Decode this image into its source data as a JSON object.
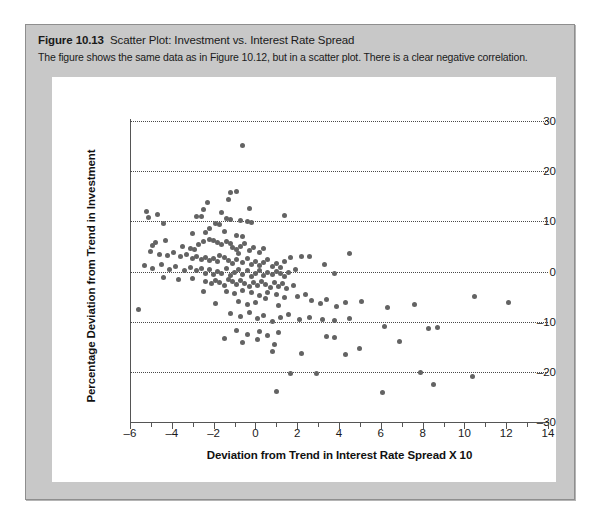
{
  "caption": {
    "figure_number": "Figure 10.13",
    "title": "Scatter Plot: Investment vs. Interest Rate Spread",
    "description": "The figure shows the same data as in Figure 10.12, but in a scatter plot. There is a clear negative correlation."
  },
  "colors": {
    "card_background": "#c8c8c8",
    "card_border": "#8e8e8e",
    "plot_background": "#ffffff",
    "dot": "#636363",
    "axis": "#555555",
    "gridline": "#4a4a4a",
    "text": "#1a1a1a"
  },
  "chart_data": {
    "type": "scatter",
    "title": "Scatter Plot: Investment vs. Interest Rate Spread",
    "xlabel": "Deviation from Trend in Interest Rate Spread X 10",
    "ylabel": "Percentage Deviation from Trend in Investment",
    "xlim": [
      -6,
      14
    ],
    "ylim": [
      -30,
      30
    ],
    "x_ticks": [
      -6,
      -4,
      -2,
      0,
      2,
      4,
      6,
      8,
      10,
      12,
      14
    ],
    "x_tick_labels": [
      "–6",
      "–4",
      "–2",
      "0",
      "2",
      "4",
      "6",
      "8",
      "10",
      "12",
      "14"
    ],
    "x_minor_ticks": [
      -5,
      -3,
      -1,
      1,
      3,
      5,
      7,
      9,
      11,
      13
    ],
    "y_ticks": [
      -30,
      -20,
      -10,
      0,
      10,
      20,
      30
    ],
    "y_tick_labels": [
      "–30",
      "–20",
      "–10",
      "0",
      "10",
      "20",
      "30"
    ],
    "grid": "horizontal-dotted",
    "legend": null,
    "annotations": [
      "There is a clear negative correlation."
    ],
    "marker": {
      "shape": "circle",
      "size_px": 5,
      "color": "#636363"
    },
    "series": [
      {
        "name": "Investment vs. Interest Rate Spread",
        "points": [
          [
            -0.6,
            25.2
          ],
          [
            -1.2,
            15.8
          ],
          [
            -0.9,
            16.0
          ],
          [
            -1.3,
            14.3
          ],
          [
            -2.3,
            13.8
          ],
          [
            -2.5,
            12.4
          ],
          [
            -0.3,
            12.6
          ],
          [
            -5.2,
            11.9
          ],
          [
            -4.7,
            11.4
          ],
          [
            -2.8,
            11.0
          ],
          [
            -2.6,
            10.9
          ],
          [
            -1.6,
            11.8
          ],
          [
            -1.4,
            10.6
          ],
          [
            -1.2,
            10.3
          ],
          [
            -0.7,
            10.1
          ],
          [
            -0.4,
            10.0
          ],
          [
            -5.1,
            10.8
          ],
          [
            -4.4,
            9.6
          ],
          [
            1.4,
            11.1
          ],
          [
            -1.7,
            9.3
          ],
          [
            -1.9,
            9.5
          ],
          [
            -0.2,
            9.8
          ],
          [
            -2.2,
            8.5
          ],
          [
            -2.4,
            7.7
          ],
          [
            -3.0,
            7.5
          ],
          [
            -1.5,
            7.9
          ],
          [
            -0.9,
            7.2
          ],
          [
            -0.6,
            7.0
          ],
          [
            -4.3,
            6.2
          ],
          [
            -4.8,
            5.8
          ],
          [
            -4.9,
            5.2
          ],
          [
            -3.5,
            5.0
          ],
          [
            -3.1,
            4.6
          ],
          [
            -2.9,
            4.4
          ],
          [
            -2.7,
            5.4
          ],
          [
            -2.5,
            5.9
          ],
          [
            -2.2,
            6.3
          ],
          [
            -2.0,
            6.1
          ],
          [
            -1.8,
            5.7
          ],
          [
            -1.6,
            5.3
          ],
          [
            -1.4,
            6.0
          ],
          [
            -1.2,
            5.5
          ],
          [
            -1.1,
            4.8
          ],
          [
            -0.9,
            4.3
          ],
          [
            -0.7,
            4.9
          ],
          [
            -0.5,
            5.6
          ],
          [
            -0.3,
            4.1
          ],
          [
            -0.1,
            4.7
          ],
          [
            0.2,
            3.8
          ],
          [
            0.4,
            4.5
          ],
          [
            -5.0,
            4.0
          ],
          [
            -4.6,
            3.4
          ],
          [
            -4.2,
            3.1
          ],
          [
            -3.9,
            3.7
          ],
          [
            -3.6,
            2.9
          ],
          [
            -3.3,
            3.3
          ],
          [
            -3.0,
            2.6
          ],
          [
            -2.8,
            3.0
          ],
          [
            -2.6,
            2.3
          ],
          [
            -2.4,
            2.8
          ],
          [
            -2.2,
            2.1
          ],
          [
            -2.0,
            2.5
          ],
          [
            -1.8,
            1.9
          ],
          [
            -1.7,
            3.2
          ],
          [
            -1.5,
            2.7
          ],
          [
            -1.3,
            2.2
          ],
          [
            -1.1,
            1.6
          ],
          [
            -0.9,
            2.4
          ],
          [
            -0.8,
            3.5
          ],
          [
            -0.6,
            1.8
          ],
          [
            -0.4,
            2.6
          ],
          [
            -0.2,
            1.4
          ],
          [
            0.0,
            2.0
          ],
          [
            0.2,
            1.2
          ],
          [
            0.4,
            1.7
          ],
          [
            0.6,
            2.3
          ],
          [
            0.8,
            1.0
          ],
          [
            1.0,
            1.5
          ],
          [
            1.2,
            0.8
          ],
          [
            1.4,
            1.9
          ],
          [
            1.7,
            2.8
          ],
          [
            2.2,
            3.0
          ],
          [
            2.6,
            2.9
          ],
          [
            4.5,
            3.6
          ],
          [
            -5.3,
            1.1
          ],
          [
            -4.9,
            0.6
          ],
          [
            -4.5,
            1.3
          ],
          [
            -4.1,
            0.4
          ],
          [
            -3.8,
            0.9
          ],
          [
            -3.4,
            0.2
          ],
          [
            -3.1,
            0.7
          ],
          [
            -2.8,
            0.1
          ],
          [
            -2.6,
            0.5
          ],
          [
            -2.4,
            -0.3
          ],
          [
            -2.2,
            0.3
          ],
          [
            -2.0,
            -0.6
          ],
          [
            -1.8,
            0.0
          ],
          [
            -1.6,
            -0.4
          ],
          [
            -1.4,
            0.6
          ],
          [
            -1.2,
            -0.8
          ],
          [
            -1.0,
            -0.2
          ],
          [
            -0.8,
            0.4
          ],
          [
            -0.6,
            -0.5
          ],
          [
            -0.4,
            0.1
          ],
          [
            -0.2,
            -0.9
          ],
          [
            0.0,
            -0.3
          ],
          [
            0.2,
            0.2
          ],
          [
            0.4,
            -0.7
          ],
          [
            0.6,
            -0.1
          ],
          [
            0.8,
            -0.6
          ],
          [
            1.0,
            0.0
          ],
          [
            1.2,
            -0.4
          ],
          [
            1.4,
            -0.9
          ],
          [
            1.6,
            -0.2
          ],
          [
            1.9,
            0.3
          ],
          [
            3.3,
            1.4
          ],
          [
            3.8,
            -0.4
          ],
          [
            -4.4,
            -1.2
          ],
          [
            -3.7,
            -1.6
          ],
          [
            -3.0,
            -1.4
          ],
          [
            -2.4,
            -1.9
          ],
          [
            -2.1,
            -2.4
          ],
          [
            -1.9,
            -1.7
          ],
          [
            -1.7,
            -2.2
          ],
          [
            -1.5,
            -2.8
          ],
          [
            -1.3,
            -1.5
          ],
          [
            -1.1,
            -2.0
          ],
          [
            -0.9,
            -2.6
          ],
          [
            -0.7,
            -1.8
          ],
          [
            -0.5,
            -2.3
          ],
          [
            -0.3,
            -3.0
          ],
          [
            -0.1,
            -2.1
          ],
          [
            0.1,
            -2.7
          ],
          [
            0.3,
            -1.9
          ],
          [
            0.5,
            -2.5
          ],
          [
            0.7,
            -3.2
          ],
          [
            0.9,
            -2.2
          ],
          [
            1.1,
            -2.9
          ],
          [
            1.3,
            -2.4
          ],
          [
            1.5,
            -3.4
          ],
          [
            1.8,
            -2.7
          ],
          [
            -1.4,
            -3.9
          ],
          [
            -1.0,
            -4.4
          ],
          [
            -0.6,
            -3.7
          ],
          [
            -0.2,
            -4.2
          ],
          [
            0.2,
            -4.8
          ],
          [
            0.6,
            -4.1
          ],
          [
            1.0,
            -4.6
          ],
          [
            1.4,
            -5.2
          ],
          [
            -2.5,
            -4.0
          ],
          [
            -5.6,
            -7.5
          ],
          [
            -1.9,
            -6.3
          ],
          [
            -0.8,
            -5.9
          ],
          [
            -0.4,
            -6.6
          ],
          [
            0.0,
            -6.1
          ],
          [
            0.5,
            -5.4
          ],
          [
            1.1,
            -6.8
          ],
          [
            2.0,
            -5.0
          ],
          [
            2.4,
            -4.5
          ],
          [
            2.7,
            -5.8
          ],
          [
            3.1,
            -6.4
          ],
          [
            3.4,
            -5.6
          ],
          [
            3.9,
            -6.9
          ],
          [
            4.3,
            -6.2
          ],
          [
            5.1,
            -6.0
          ],
          [
            6.3,
            -7.1
          ],
          [
            7.6,
            -6.5
          ],
          [
            10.5,
            -5.0
          ],
          [
            12.1,
            -6.2
          ],
          [
            -1.2,
            -8.4
          ],
          [
            -0.7,
            -9.0
          ],
          [
            -0.3,
            -8.2
          ],
          [
            0.1,
            -9.4
          ],
          [
            0.4,
            -8.8
          ],
          [
            0.8,
            -9.9
          ],
          [
            1.2,
            -9.2
          ],
          [
            1.6,
            -8.6
          ],
          [
            2.1,
            -9.6
          ],
          [
            2.6,
            -9.1
          ],
          [
            3.2,
            -9.5
          ],
          [
            3.8,
            -9.8
          ],
          [
            4.5,
            -9.3
          ],
          [
            6.2,
            -10.9
          ],
          [
            8.3,
            -11.4
          ],
          [
            8.7,
            -11.1
          ],
          [
            -0.9,
            -11.7
          ],
          [
            -0.4,
            -12.5
          ],
          [
            0.2,
            -11.9
          ],
          [
            0.6,
            -12.8
          ],
          [
            1.1,
            -12.2
          ],
          [
            -1.5,
            -13.4
          ],
          [
            -0.6,
            -14.1
          ],
          [
            0.1,
            -13.6
          ],
          [
            0.9,
            -14.6
          ],
          [
            3.4,
            -13.0
          ],
          [
            3.8,
            -13.1
          ],
          [
            6.9,
            -13.9
          ],
          [
            5.0,
            -15.4
          ],
          [
            0.8,
            -16.0
          ],
          [
            2.2,
            -16.3
          ],
          [
            4.3,
            -16.6
          ],
          [
            1.7,
            -20.3
          ],
          [
            7.9,
            -20.1
          ],
          [
            10.4,
            -21.0
          ],
          [
            8.5,
            -22.5
          ],
          [
            1.0,
            -23.9
          ],
          [
            6.1,
            -24.2
          ],
          [
            2.9,
            -20.4
          ]
        ]
      }
    ]
  }
}
